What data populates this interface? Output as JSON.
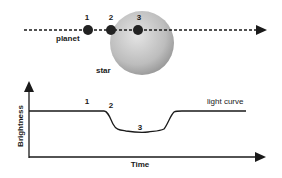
{
  "top_panel": {
    "positions": [
      {
        "label": "1",
        "x": 88
      },
      {
        "label": "2",
        "x": 111
      },
      {
        "label": "3",
        "x": 138
      }
    ],
    "planet_label": "planet",
    "star_label": "star"
  },
  "bottom_panel": {
    "y_axis_label": "Brightness",
    "x_axis_label": "Time",
    "curve_label": "light curve",
    "curve_points": [
      {
        "label": "1",
        "x": 87,
        "y": 103
      },
      {
        "label": "2",
        "x": 111,
        "y": 107
      },
      {
        "label": "3",
        "x": 140,
        "y": 128
      }
    ]
  },
  "colors": {
    "line": "#1a1a1a",
    "planet": "#222222",
    "star_light": "#d8d8d8",
    "star_dark": "#9a9a9a"
  }
}
